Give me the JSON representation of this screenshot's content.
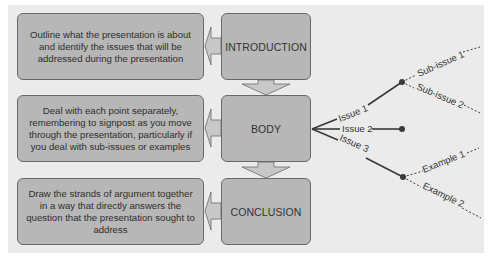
{
  "diagram": {
    "stages": [
      {
        "label": "INTRODUCTION",
        "description": "Outline what the presentation is about and identify the issues that will be addressed during the presentation"
      },
      {
        "label": "BODY",
        "description": "Deal with each point separately, remembering to signpost as you move through the presentation, particularly if you deal with sub-issues or examples"
      },
      {
        "label": "CONCLUSION",
        "description": "Draw the strands of argument together in a way that directly answers the question that the presentation sought to address"
      }
    ],
    "branches": {
      "issue1": {
        "label": "Issue 1",
        "children": [
          "Sub-issue 1",
          "Sub-issue 2"
        ]
      },
      "issue2": {
        "label": "Issue 2",
        "children": []
      },
      "issue3": {
        "label": "Issue 3",
        "children": [
          "Example 1",
          "Example 2"
        ]
      }
    },
    "colors": {
      "panel": "#ebebeb",
      "box_fill": "#b7b7b7",
      "box_border": "#6a6a6a",
      "arrow_fill": "#c8c8c8",
      "line": "#3a3a3a"
    }
  }
}
